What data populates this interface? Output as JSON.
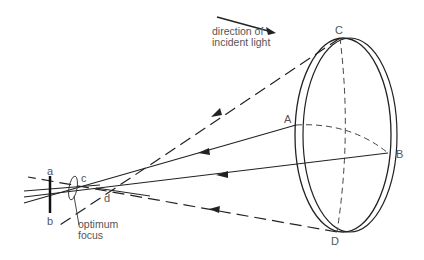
{
  "diagram": {
    "type": "ray diagram of a lens (spherical aberration / optimum focus)",
    "caption_direction": [
      "direction of",
      "incident light"
    ],
    "caption_focus": [
      "optimum",
      "focus"
    ],
    "points": {
      "A": "A",
      "B": "B",
      "C": "C",
      "D": "D",
      "a": "a",
      "b": "b",
      "c": "c",
      "d": "d"
    },
    "colors": {
      "line": "#222222",
      "label": "#555555",
      "background": "#ffffff"
    }
  }
}
